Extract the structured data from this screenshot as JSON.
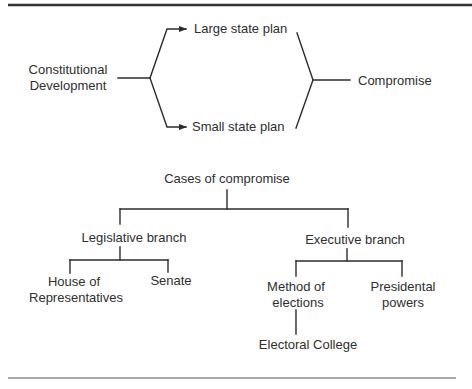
{
  "diagram_type": "concept-flow-and-tree",
  "flow": {
    "source": {
      "lines": [
        "Constitutional",
        "Development"
      ]
    },
    "branches": [
      {
        "label": "Large state plan"
      },
      {
        "label": "Small state plan"
      }
    ],
    "result": {
      "label": "Compromise"
    }
  },
  "tree": {
    "root": {
      "label": "Cases of compromise"
    },
    "legislative": {
      "label": "Legislative branch",
      "children": [
        {
          "lines": [
            "House of",
            "Representatives"
          ]
        },
        {
          "lines": [
            "Senate"
          ]
        }
      ]
    },
    "executive": {
      "label": "Executive branch",
      "children": [
        {
          "lines": [
            "Method of",
            "elections"
          ],
          "child": {
            "label": "Electoral College"
          }
        },
        {
          "lines": [
            "Presidental",
            "powers"
          ]
        }
      ]
    }
  },
  "colors": {
    "ink": "#2e2e2e",
    "background": "#ffffff"
  }
}
